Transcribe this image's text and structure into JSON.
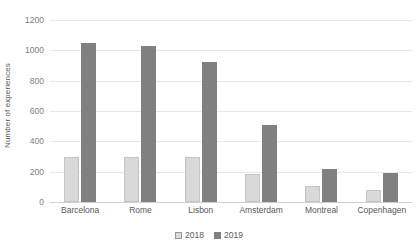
{
  "chart_data": {
    "type": "bar",
    "title": "",
    "subtitle": "",
    "xlabel": "",
    "ylabel": "Number of experiences",
    "categories": [
      "Barcelona",
      "Rome",
      "Lisbon",
      "Amsterdam",
      "Montreal",
      "Copenhagen"
    ],
    "series": [
      {
        "name": "2018",
        "color": "#d9d9d9",
        "values": [
          295,
          295,
          295,
          185,
          105,
          80
        ]
      },
      {
        "name": "2019",
        "color": "#808080",
        "values": [
          1050,
          1030,
          920,
          510,
          220,
          190
        ]
      }
    ],
    "ylim": [
      0,
      1200
    ],
    "ytick_values": [
      0,
      200,
      400,
      600,
      800,
      1000,
      1200
    ],
    "ytick_labels": [
      "0",
      "200",
      "400",
      "600",
      "800",
      "1000",
      "1200"
    ],
    "grid": true,
    "grid_axis": "y",
    "legend": true,
    "legend_position": "bottom",
    "legend_entries": [
      "2018",
      "2019"
    ],
    "axis_text_color": "#595959",
    "gridline_color": "#e8e8e8"
  }
}
